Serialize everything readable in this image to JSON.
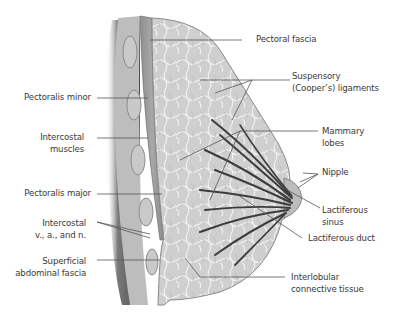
{
  "figure": {
    "colors": {
      "background": "#ffffff",
      "chest_wall_shadow": "#5a5a5a",
      "muscle": "#9a9a9a",
      "tissue": "#d4d4d4",
      "ducts": "#3c3c3c",
      "leader_lines": "#555555",
      "label_text": "#3a3a3a"
    }
  },
  "labels": {
    "left": [
      {
        "id": "pectoralis-minor",
        "lines": [
          "Pectoralis minor"
        ]
      },
      {
        "id": "intercostal-muscles",
        "lines": [
          "Intercostal",
          "muscles"
        ]
      },
      {
        "id": "pectoralis-major",
        "lines": [
          "Pectoralis major"
        ]
      },
      {
        "id": "intercostal-vessels",
        "lines": [
          "Intercostal",
          "v., a., and n."
        ]
      },
      {
        "id": "superficial-abdominal-fascia",
        "lines": [
          "Superficial",
          "abdominal fascia"
        ]
      }
    ],
    "right": [
      {
        "id": "pectoral-fascia",
        "lines": [
          "Pectoral fascia"
        ]
      },
      {
        "id": "suspensory-ligaments",
        "lines": [
          "Suspensory",
          "(Cooper’s) ligaments"
        ]
      },
      {
        "id": "mammary-lobes",
        "lines": [
          "Mammary",
          "lobes"
        ]
      },
      {
        "id": "nipple",
        "lines": [
          "Nipple"
        ]
      },
      {
        "id": "lactiferous-sinus",
        "lines": [
          "Lactiferous",
          "sinus"
        ]
      },
      {
        "id": "lactiferous-duct",
        "lines": [
          "Lactiferous duct"
        ]
      },
      {
        "id": "interlobular-connective-tissue",
        "lines": [
          "Interlobular",
          "connective tissue"
        ]
      }
    ]
  }
}
